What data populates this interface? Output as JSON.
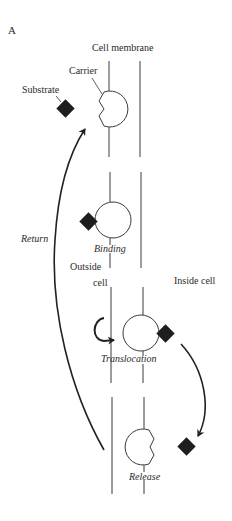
{
  "figure": {
    "panel_label": "A",
    "colors": {
      "line": "#3a3a3a",
      "substrate": "#1e1e1e",
      "arrow": "#222222",
      "background": "#ffffff"
    },
    "labels": {
      "cell_membrane": "Cell membrane",
      "carrier": "Carrier",
      "substrate": "Substrate",
      "return": "Return",
      "binding": "Binding",
      "outside_cell_line1": "Outside",
      "outside_cell_line2": "cell",
      "inside_cell": "Inside cell",
      "translocation": "Translocation",
      "release": "Release"
    },
    "stages": [
      {
        "name": "Initial",
        "substrate_bound": false,
        "carrier_side": "outside"
      },
      {
        "name": "Binding",
        "substrate_bound": true,
        "carrier_side": "outside"
      },
      {
        "name": "Translocation",
        "substrate_bound": true,
        "carrier_side": "inside"
      },
      {
        "name": "Release",
        "substrate_bound": false,
        "carrier_side": "inside"
      }
    ]
  }
}
